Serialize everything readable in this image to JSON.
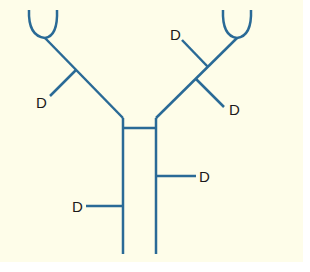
{
  "diagram": {
    "title": "",
    "colors": {
      "background": "#fefde9",
      "line": "#2a6a96",
      "label": "#1a1a1a"
    },
    "labels": {
      "drug_upper_left": "D",
      "drug_upper_right_top": "D",
      "drug_upper_right_bottom": "D",
      "drug_stem_right": "D",
      "drug_stem_left": "D"
    }
  }
}
